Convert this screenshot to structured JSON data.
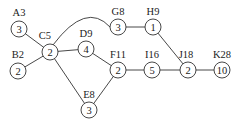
{
  "diagram": {
    "type": "activity-network",
    "node_radius": 8,
    "nodes": [
      {
        "id": "A",
        "label": "A3",
        "value": "3",
        "x": 19,
        "y": 29,
        "lx": 19,
        "ly": 16
      },
      {
        "id": "B",
        "label": "B2",
        "value": "2",
        "x": 18,
        "y": 71,
        "lx": 18,
        "ly": 58
      },
      {
        "id": "C",
        "label": "C5",
        "value": "2",
        "x": 50,
        "y": 52,
        "lx": 45,
        "ly": 39
      },
      {
        "id": "D",
        "label": "D9",
        "value": "4",
        "x": 86,
        "y": 49,
        "lx": 86,
        "ly": 37
      },
      {
        "id": "E",
        "label": "E8",
        "value": "3",
        "x": 89,
        "y": 110,
        "lx": 89,
        "ly": 98
      },
      {
        "id": "F",
        "label": "F11",
        "value": "2",
        "x": 118,
        "y": 70,
        "lx": 118,
        "ly": 58
      },
      {
        "id": "G",
        "label": "G8",
        "value": "3",
        "x": 118,
        "y": 27,
        "lx": 118,
        "ly": 15
      },
      {
        "id": "H",
        "label": "H9",
        "value": "1",
        "x": 153,
        "y": 27,
        "lx": 153,
        "ly": 15
      },
      {
        "id": "I",
        "label": "I16",
        "value": "5",
        "x": 152,
        "y": 70,
        "lx": 152,
        "ly": 58
      },
      {
        "id": "J",
        "label": "J18",
        "value": "2",
        "x": 188,
        "y": 70,
        "lx": 186,
        "ly": 58
      },
      {
        "id": "K",
        "label": "K28",
        "value": "10",
        "x": 222,
        "y": 70,
        "lx": 222,
        "ly": 58
      }
    ],
    "edges": [
      {
        "from": "A",
        "to": "C"
      },
      {
        "from": "B",
        "to": "C"
      },
      {
        "from": "C",
        "to": "G",
        "curved": true
      },
      {
        "from": "C",
        "to": "D"
      },
      {
        "from": "C",
        "to": "E"
      },
      {
        "from": "D",
        "to": "F"
      },
      {
        "from": "E",
        "to": "F"
      },
      {
        "from": "G",
        "to": "H"
      },
      {
        "from": "H",
        "to": "J"
      },
      {
        "from": "F",
        "to": "I"
      },
      {
        "from": "I",
        "to": "J"
      },
      {
        "from": "J",
        "to": "K"
      }
    ]
  }
}
